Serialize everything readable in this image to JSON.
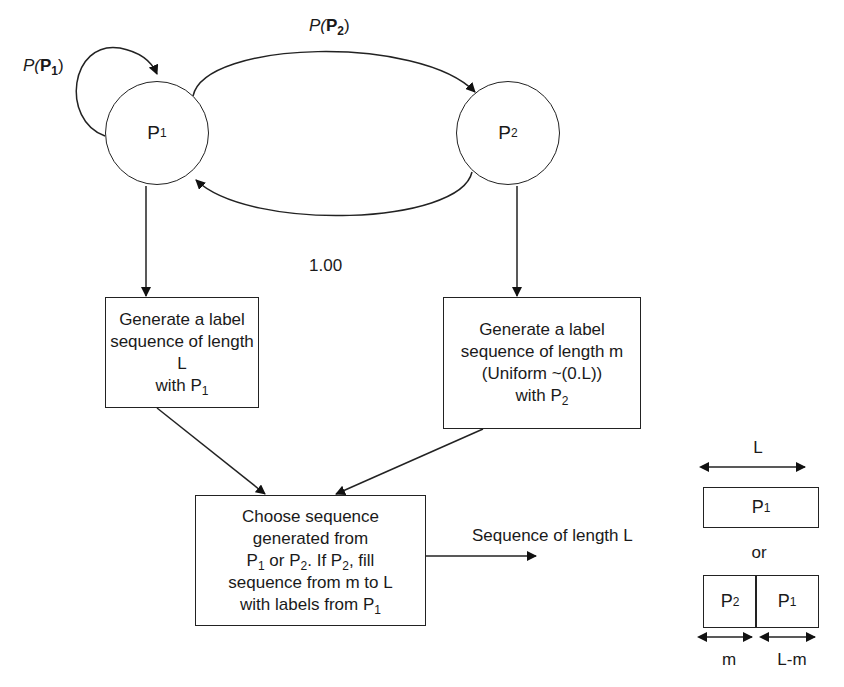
{
  "diagram": {
    "type": "state-flow",
    "nodes": {
      "p1": {
        "label": "P",
        "sub": "1"
      },
      "p2": {
        "label": "P",
        "sub": "2"
      }
    },
    "edges": {
      "self_loop_p1": {
        "label_prefix": "P(",
        "label_bold": "P",
        "label_sub": "1",
        "label_suffix": ")"
      },
      "p1_to_p2": {
        "label_prefix": "P(",
        "label_bold": "P",
        "label_sub": "2",
        "label_suffix": ")"
      },
      "p2_to_p1": {
        "label": "1.00"
      }
    },
    "boxes": {
      "generate_p1": {
        "line1": "Generate a label",
        "line2": "sequence of length L",
        "line3_prefix": "with P",
        "line3_sub": "1"
      },
      "generate_p2": {
        "line1": "Generate a label",
        "line2": "sequence of length m",
        "line3": "(Uniform ~(0.L))",
        "line4_prefix": "with P",
        "line4_sub": "2"
      },
      "choose": {
        "line1": "Choose sequence",
        "line2": "generated from",
        "line3_a": "P",
        "line3_a_sub": "1",
        "line3_b": " or P",
        "line3_b_sub": "2",
        "line3_c": ". If P",
        "line3_c_sub": "2",
        "line3_d": ", fill",
        "line4": "sequence from m to L",
        "line5_prefix": "with labels from P",
        "line5_sub": "1"
      }
    },
    "output_label": "Sequence of length L",
    "legend": {
      "length_label": "L",
      "full_segment": {
        "label": "P",
        "sub": "1"
      },
      "or_label": "or",
      "split_left": {
        "label": "P",
        "sub": "2"
      },
      "split_right": {
        "label": "P",
        "sub": "1"
      },
      "m_label": "m",
      "lm_label": "L-m"
    }
  }
}
